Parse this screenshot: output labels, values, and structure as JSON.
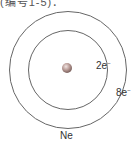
{
  "header": {
    "cropped_text": "(编号1-5)："
  },
  "diagram": {
    "element_symbol": "Ne",
    "shells": [
      {
        "index": 1,
        "electrons": "2e",
        "charge_sign": "−"
      },
      {
        "index": 2,
        "electrons": "8e",
        "charge_sign": "−"
      }
    ],
    "colors": {
      "shell_stroke": "#666666",
      "nucleus_fill": "#b89a95",
      "text": "#333333"
    }
  }
}
